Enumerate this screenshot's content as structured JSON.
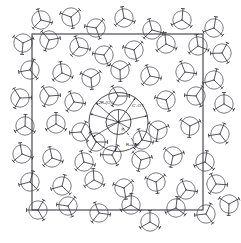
{
  "figure": {
    "background_color": "#ffffff",
    "width": 241,
    "height": 243
  },
  "unit_cell": {
    "name": "unit-cell-square",
    "stroke_color": "#3a3a42",
    "x": 32,
    "y": 34,
    "width": 171,
    "height": 176
  },
  "center": {
    "x": 118.5,
    "y": 122.0
  },
  "radius_shells": [
    {
      "name": "inner-shell",
      "r": 12.5
    },
    {
      "name": "outer-shell",
      "r": 29.5
    }
  ],
  "labels": {
    "upper_left": "√2R₁(O₄)",
    "upper_right": "C'-OT",
    "lower": "R₂=3O",
    "inner_tick": "R₁"
  },
  "molecule": {
    "name": "trigonal-planar-molecule",
    "circle_radius": 9.2,
    "spoke_length": 11.4,
    "circle_color": "#4d4d55",
    "spoke_color": "#2b2b33"
  },
  "chart_data": {
    "type": "scatter",
    "xlabel": "",
    "ylabel": "",
    "xlim": [
      0,
      241
    ],
    "ylim": [
      0,
      243
    ],
    "grid": false,
    "legend": "none",
    "annotations": [
      {
        "text": "√2R₁(O₄)",
        "x": 96,
        "y": 104
      },
      {
        "text": "C'-OT",
        "x": 132,
        "y": 107
      },
      {
        "text": "R₂=3O",
        "x": 126,
        "y": 146
      }
    ],
    "series": [
      {
        "name": "molecules",
        "marker": "circle-with-trigonal-spokes",
        "points": [
          {
            "x": 41,
            "y": 20,
            "rot": 14
          },
          {
            "x": 71,
            "y": 17,
            "rot": 200
          },
          {
            "x": 96,
            "y": 28,
            "rot": 70
          },
          {
            "x": 124,
            "y": 18,
            "rot": 140
          },
          {
            "x": 152,
            "y": 30,
            "rot": 255
          },
          {
            "x": 182,
            "y": 20,
            "rot": 35
          },
          {
            "x": 214,
            "y": 28,
            "rot": 160
          },
          {
            "x": 23,
            "y": 43,
            "rot": 95
          },
          {
            "x": 49,
            "y": 40,
            "rot": 230
          },
          {
            "x": 79,
            "y": 47,
            "rot": 12
          },
          {
            "x": 104,
            "y": 55,
            "rot": 188
          },
          {
            "x": 134,
            "y": 50,
            "rot": 76
          },
          {
            "x": 166,
            "y": 44,
            "rot": 144
          },
          {
            "x": 198,
            "y": 46,
            "rot": 262
          },
          {
            "x": 222,
            "y": 53,
            "rot": 58
          },
          {
            "x": 30,
            "y": 70,
            "rot": 170
          },
          {
            "x": 62,
            "y": 73,
            "rot": 22
          },
          {
            "x": 91,
            "y": 78,
            "rot": 205
          },
          {
            "x": 120,
            "y": 70,
            "rot": 88
          },
          {
            "x": 150,
            "y": 76,
            "rot": 132
          },
          {
            "x": 185,
            "y": 72,
            "rot": 248
          },
          {
            "x": 214,
            "y": 80,
            "rot": 44
          },
          {
            "x": 20,
            "y": 98,
            "rot": 118
          },
          {
            "x": 49,
            "y": 96,
            "rot": 236
          },
          {
            "x": 74,
            "y": 102,
            "rot": 8
          },
          {
            "x": 166,
            "y": 100,
            "rot": 194
          },
          {
            "x": 196,
            "y": 96,
            "rot": 64
          },
          {
            "x": 224,
            "y": 104,
            "rot": 150
          },
          {
            "x": 25,
            "y": 126,
            "rot": 272
          },
          {
            "x": 56,
            "y": 124,
            "rot": 30
          },
          {
            "x": 81,
            "y": 132,
            "rot": 176
          },
          {
            "x": 158,
            "y": 130,
            "rot": 98
          },
          {
            "x": 190,
            "y": 126,
            "rot": 214
          },
          {
            "x": 220,
            "y": 134,
            "rot": 52
          },
          {
            "x": 22,
            "y": 154,
            "rot": 140
          },
          {
            "x": 52,
            "y": 158,
            "rot": 258
          },
          {
            "x": 84,
            "y": 162,
            "rot": 16
          },
          {
            "x": 112,
            "y": 155,
            "rot": 182
          },
          {
            "x": 141,
            "y": 160,
            "rot": 104
          },
          {
            "x": 173,
            "y": 156,
            "rot": 222
          },
          {
            "x": 205,
            "y": 162,
            "rot": 40
          },
          {
            "x": 30,
            "y": 182,
            "rot": 166
          },
          {
            "x": 62,
            "y": 186,
            "rot": 284
          },
          {
            "x": 94,
            "y": 180,
            "rot": 26
          },
          {
            "x": 124,
            "y": 188,
            "rot": 200
          },
          {
            "x": 156,
            "y": 182,
            "rot": 82
          },
          {
            "x": 186,
            "y": 190,
            "rot": 128
          },
          {
            "x": 216,
            "y": 184,
            "rot": 244
          },
          {
            "x": 38,
            "y": 210,
            "rot": 60
          },
          {
            "x": 68,
            "y": 206,
            "rot": 188
          },
          {
            "x": 99,
            "y": 213,
            "rot": 8
          },
          {
            "x": 131,
            "y": 205,
            "rot": 152
          },
          {
            "x": 150,
            "y": 222,
            "rot": 270
          },
          {
            "x": 176,
            "y": 208,
            "rot": 36
          },
          {
            "x": 206,
            "y": 214,
            "rot": 174
          },
          {
            "x": 229,
            "y": 204,
            "rot": 92
          },
          {
            "x": 118,
            "y": 96,
            "rot": 120
          },
          {
            "x": 96,
            "y": 142,
            "rot": 240
          },
          {
            "x": 142,
            "y": 140,
            "rot": 12
          }
        ]
      }
    ]
  }
}
